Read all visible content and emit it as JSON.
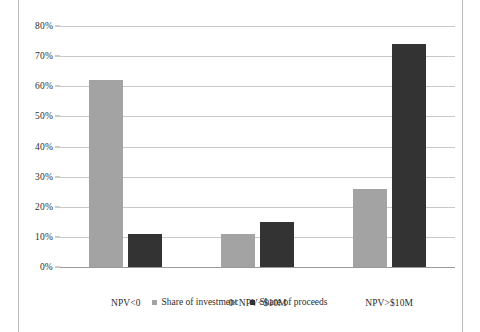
{
  "chart_data": {
    "type": "bar",
    "title": "",
    "subtitle": "",
    "xlabel": "",
    "ylabel": "",
    "categories": [
      "NPV<0",
      "0<NPV<$10M",
      "NPV>$10M"
    ],
    "series": [
      {
        "name": "Share of investment",
        "color": "#a3a3a3",
        "values": [
          62,
          11,
          26
        ],
        "value_labels": [
          "62%",
          "11%",
          "26%"
        ]
      },
      {
        "name": "Share of proceeds",
        "color": "#333333",
        "values": [
          11,
          15,
          74
        ],
        "value_labels": [
          "11%",
          "15%",
          "74%"
        ]
      }
    ],
    "ylim": [
      0,
      80
    ],
    "ytick_values": [
      0,
      10,
      20,
      30,
      40,
      50,
      60,
      70,
      80
    ],
    "ytick_labels": [
      "0%",
      "10%",
      "20%",
      "30%",
      "40%",
      "50%",
      "60%",
      "70%",
      "80%"
    ],
    "grid": true,
    "legend_position": "bottom"
  },
  "axis": {
    "y": {
      "ticks": [
        {
          "label": "80%",
          "value": 80
        },
        {
          "label": "70%",
          "value": 70
        },
        {
          "label": "60%",
          "value": 60
        },
        {
          "label": "50%",
          "value": 50
        },
        {
          "label": "40%",
          "value": 40
        },
        {
          "label": "30%",
          "value": 30
        },
        {
          "label": "20%",
          "value": 20
        },
        {
          "label": "10%",
          "value": 10
        },
        {
          "label": "0%",
          "value": 0
        }
      ]
    },
    "x": {
      "categories": [
        {
          "label": "NPV<0"
        },
        {
          "label": "0<NPV<$10M"
        },
        {
          "label": "NPV>$10M"
        }
      ]
    }
  },
  "legend": {
    "items": [
      {
        "label": "Share of investment",
        "swatch": "legend-swatch-investment"
      },
      {
        "label": "Share of proceeds",
        "swatch": "legend-swatch-proceeds"
      }
    ]
  },
  "colors": {
    "investment": "#a3a3a3",
    "proceeds": "#333333",
    "gridline": "#c8c8c8",
    "baseline": "#9a9a9a",
    "frame": "#b9b9b9",
    "text": "#2e2e2e"
  }
}
